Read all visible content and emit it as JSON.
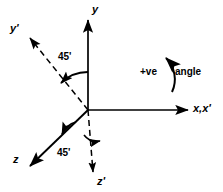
{
  "figure": {
    "background_color": "#ffffff",
    "stroke_color": "#000000",
    "origin": {
      "x": 88,
      "y": 110
    }
  },
  "axes": [
    {
      "id": "y",
      "label": "y",
      "style": "solid",
      "arrow": true,
      "from": {
        "x": 88,
        "y": 110
      },
      "to": {
        "x": 88,
        "y": 18
      }
    },
    {
      "id": "x-xprime",
      "label": "x,x'",
      "style": "solid",
      "arrow": true,
      "from": {
        "x": 88,
        "y": 110
      },
      "to": {
        "x": 190,
        "y": 110
      }
    },
    {
      "id": "z",
      "label": "z",
      "style": "solid",
      "arrow": true,
      "from": {
        "x": 88,
        "y": 110
      },
      "to": {
        "x": 28,
        "y": 168
      }
    },
    {
      "id": "yprime",
      "label": "y'",
      "style": "dashed",
      "arrow": true,
      "from": {
        "x": 88,
        "y": 110
      },
      "to": {
        "x": 28,
        "y": 36
      }
    },
    {
      "id": "zprime",
      "label": "z'",
      "style": "dashed",
      "arrow": true,
      "from": {
        "x": 88,
        "y": 110
      },
      "to": {
        "x": 93,
        "y": 176
      }
    }
  ],
  "angles": [
    {
      "id": "angle-y-yprime",
      "label": "45'",
      "value": 45,
      "unit": "degrees"
    },
    {
      "id": "angle-z-zprime",
      "label": "45'",
      "value": 45,
      "unit": "degrees"
    }
  ],
  "annotations": {
    "positive_sense": "+ve",
    "positive_sense_word": "angle",
    "rotation_arc_direction": "counterclockwise"
  }
}
